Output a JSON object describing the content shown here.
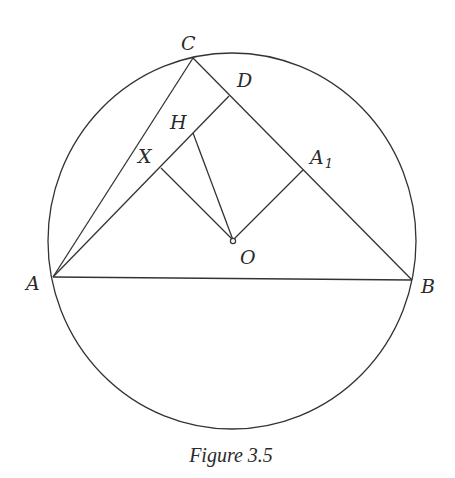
{
  "figure": {
    "caption": "Figure 3.5",
    "circle": {
      "cx": 232,
      "cy": 241,
      "rx": 184,
      "ry": 188
    },
    "points": {
      "A": {
        "label": "A",
        "x": 53,
        "y": 277
      },
      "B": {
        "label": "B",
        "x": 412,
        "y": 280
      },
      "C": {
        "label": "C",
        "x": 193,
        "y": 58
      },
      "D": {
        "label": "D",
        "x": 229,
        "y": 96
      },
      "H": {
        "label": "H",
        "x": 193,
        "y": 133
      },
      "X": {
        "label": "X",
        "x": 161,
        "y": 168
      },
      "A1": {
        "label": "A",
        "subscript": "1",
        "x": 303,
        "y": 170
      },
      "O": {
        "label": "O",
        "x": 233,
        "y": 240
      }
    },
    "segments": [
      [
        "A",
        "B"
      ],
      [
        "B",
        "C"
      ],
      [
        "C",
        "A"
      ],
      [
        "A",
        "D"
      ],
      [
        "X",
        "O"
      ],
      [
        "H",
        "O"
      ],
      [
        "A1",
        "O"
      ]
    ],
    "colors": {
      "stroke": "#333333",
      "background": "#ffffff"
    }
  }
}
